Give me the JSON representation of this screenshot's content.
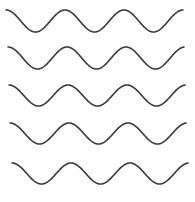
{
  "image": {
    "description": "Five stacked horizontal sine waves",
    "background": "#ffffff",
    "stroke_color": "#3a3a3a"
  },
  "waves": [
    {
      "start_x": 6,
      "end_x": 183,
      "peak_y": 10,
      "trough_y": 32,
      "period": 59,
      "start_phase": "peak"
    },
    {
      "start_x": 8,
      "end_x": 184,
      "peak_y": 47,
      "trough_y": 69,
      "period": 59,
      "start_phase": "peak"
    },
    {
      "start_x": 9,
      "end_x": 185,
      "peak_y": 85,
      "trough_y": 106,
      "period": 59,
      "start_phase": "peak"
    },
    {
      "start_x": 10,
      "end_x": 186,
      "peak_y": 123,
      "trough_y": 144,
      "period": 59,
      "start_phase": "peak"
    },
    {
      "start_x": 12,
      "end_x": 188,
      "peak_y": 163,
      "trough_y": 184,
      "period": 59,
      "start_phase": "peak"
    }
  ]
}
